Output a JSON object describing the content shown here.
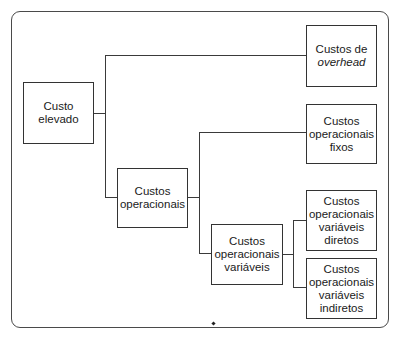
{
  "diagram": {
    "type": "tree",
    "root": {
      "id": "custo-elevado",
      "label_lines": [
        "Custo",
        "elevado"
      ]
    },
    "nodes": {
      "overhead": {
        "label_lines": [
          "Custos de",
          "overhead"
        ],
        "italic_line": "overhead"
      },
      "operacionais": {
        "label_lines": [
          "Custos",
          "operacionais"
        ]
      },
      "fixos": {
        "label_lines": [
          "Custos",
          "operacionais",
          "fixos"
        ]
      },
      "variaveis": {
        "label_lines": [
          "Custos",
          "operacionais",
          "variáveis"
        ]
      },
      "diretos": {
        "label_lines": [
          "Custos",
          "operacionais",
          "variáveis",
          "diretos"
        ]
      },
      "indiretos": {
        "label_lines": [
          "Custos",
          "operacionais",
          "variáveis",
          "indiretos"
        ]
      }
    },
    "edges": [
      [
        "custo-elevado",
        "overhead"
      ],
      [
        "custo-elevado",
        "operacionais"
      ],
      [
        "operacionais",
        "fixos"
      ],
      [
        "operacionais",
        "variaveis"
      ],
      [
        "variaveis",
        "diretos"
      ],
      [
        "variaveis",
        "indiretos"
      ]
    ],
    "colors": {
      "line": "#3a3a3a",
      "border": "#333333",
      "text": "#1a1a1a",
      "background": "#ffffff"
    }
  }
}
